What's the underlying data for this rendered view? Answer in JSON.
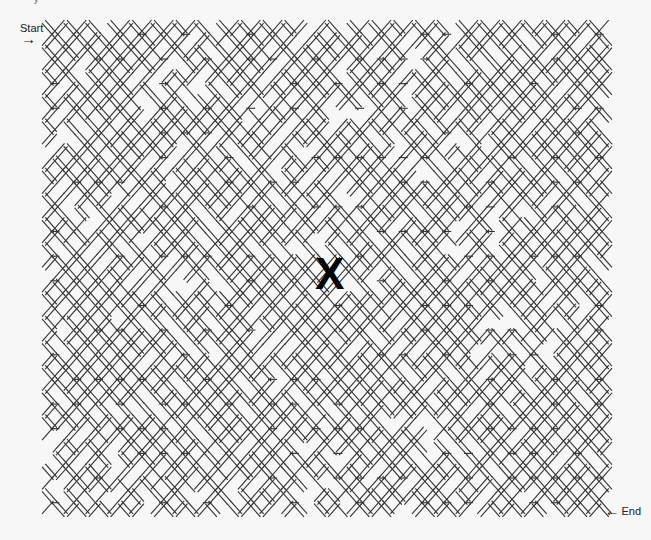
{
  "title_fragment": "y",
  "maze": {
    "type": "diamond-lattice",
    "bounds": {
      "x0": 44,
      "y0": 22,
      "x1": 610,
      "y1": 515
    },
    "cols": 26,
    "rows": 20,
    "stroke_color": "#333333",
    "background": "#f7f7f7"
  },
  "start": {
    "label": "Start",
    "arrow": "→"
  },
  "end": {
    "label": "End",
    "arrow": "←"
  },
  "marker": {
    "label": "X"
  }
}
